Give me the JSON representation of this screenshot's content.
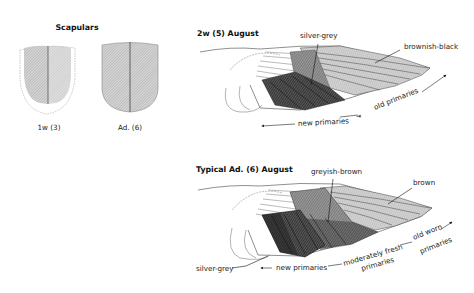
{
  "scapulars": {
    "title": "Scapulars",
    "left_caption": "1w (3)",
    "right_caption": "Ad. (6)"
  },
  "wing_top": {
    "title": "2w (5) August",
    "label_silver_grey": "silver-grey",
    "label_brownish_black": "brownish-black",
    "label_new_primaries": "new primaries",
    "label_old_primaries": "old primaries"
  },
  "wing_bottom": {
    "title": "Typical Ad. (6) August",
    "label_greyish_brown": "greyish-brown",
    "label_brown": "brown",
    "label_silver_grey": "silver-grey",
    "label_new_primaries": "new primaries",
    "label_moderately_fresh_1": "moderately fresh",
    "label_moderately_fresh_2": "primaries",
    "label_old_worn_1": "old worn",
    "label_old_worn_2": "primaries"
  },
  "colors": {
    "dark_feather": "#3a3a3a",
    "mid_feather": "#8a8a8a",
    "light_feather": "#c8c8c8",
    "outline": "#333333"
  }
}
